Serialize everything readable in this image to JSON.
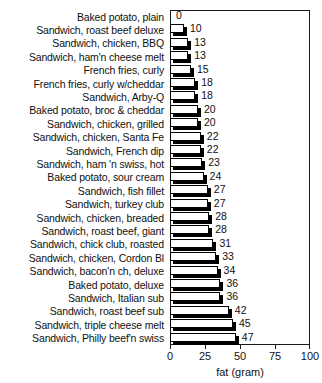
{
  "chart_data": {
    "type": "bar",
    "orientation": "horizontal",
    "title": "",
    "xlabel": "fat (gram)",
    "ylabel": "",
    "xlim": [
      0,
      100
    ],
    "xticks": [
      0,
      25,
      50,
      75,
      100
    ],
    "grid": false,
    "legend": null,
    "categories": [
      "Baked potato, plain",
      "Sandwich, roast beef deluxe",
      "Sandwich, chicken, BBQ",
      "Sandwich, ham'n cheese melt",
      "French fries, curly",
      "French fries, curly w/cheddar",
      "Sandwich, Arby-Q",
      "Baked potato, broc & cheddar",
      "Sandwich, chicken, grilled",
      "Sandwich, chicken, Santa Fe",
      "Sandwich, French dip",
      "Sandwich, ham 'n swiss, hot",
      "Baked potato, sour cream",
      "Sandwich, fish fillet",
      "Sandwich, turkey club",
      "Sandwich, chicken, breaded",
      "Sandwich, roast beef, giant",
      "Sandwich, chick club, roasted",
      "Sandwich, chicken, Cordon Bl",
      "Sandwich, bacon'n ch, deluxe",
      "Baked potato, deluxe",
      "Sandwich, Italian sub",
      "Sandwich, roast beef sub",
      "Sandwich, triple cheese melt",
      "Sandwich, Philly beef'n swiss"
    ],
    "values": [
      0,
      10,
      13,
      13,
      15,
      18,
      18,
      20,
      20,
      22,
      22,
      23,
      24,
      27,
      27,
      28,
      28,
      31,
      33,
      34,
      36,
      36,
      42,
      45,
      47
    ],
    "value_labels": [
      "0",
      "10",
      "13",
      "13",
      "15",
      "18",
      "18",
      "20",
      "20",
      "22",
      "22",
      "23",
      "24",
      "27",
      "27",
      "28",
      "28",
      "31",
      "33",
      "34",
      "36",
      "36",
      "42",
      "45",
      "47"
    ],
    "tick_labels": [
      "0",
      "25",
      "50",
      "75",
      "100"
    ],
    "colors": {
      "bar_fill": "#ffffff",
      "bar_outline": "#000000",
      "bar_shadow": "#000000",
      "axis": "#1a1a1a",
      "text": "#111111",
      "background": "#ffffff"
    }
  }
}
